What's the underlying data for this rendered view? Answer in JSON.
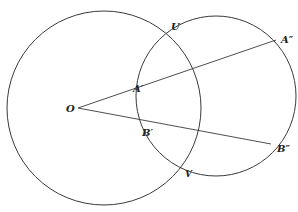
{
  "diagram": {
    "title": "",
    "colors": {
      "stroke": "#3a3a3a",
      "label": "#222222",
      "background": "#ffffff"
    },
    "circles": [
      {
        "id": "large-circle",
        "cx": 104,
        "cy": 108,
        "r": 97
      },
      {
        "id": "small-circle",
        "cx": 216,
        "cy": 96,
        "r": 80
      }
    ],
    "points": {
      "O": {
        "x": 78,
        "y": 108
      },
      "A1": {
        "x": 148,
        "y": 89
      },
      "A2": {
        "x": 276,
        "y": 40
      },
      "B1": {
        "x": 152,
        "y": 122
      },
      "B2": {
        "x": 271,
        "y": 144
      },
      "U": {
        "x": 173,
        "y": 37
      },
      "V": {
        "x": 186,
        "y": 165
      }
    },
    "segments": [
      {
        "id": "ray-O-A2",
        "from": "O",
        "to": "A2"
      },
      {
        "id": "ray-O-B2",
        "from": "O",
        "to": "B2"
      }
    ],
    "labels": {
      "O": "O",
      "A1": "A′",
      "A2": "A″",
      "B1": "B′",
      "B2": "B″",
      "U": "U",
      "V": "V"
    }
  }
}
